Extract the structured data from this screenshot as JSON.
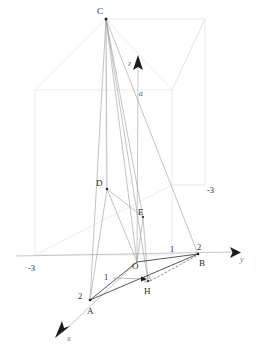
{
  "figure": {
    "background_color": "#ffffff",
    "ink_color": "#2b2b2b"
  },
  "axes": {
    "x": {
      "label": "x",
      "arrow_tip": [
        57,
        336
      ],
      "origin": [
        137,
        262
      ]
    },
    "y": {
      "label": "y",
      "arrow_tip": [
        236,
        252
      ],
      "origin": [
        137,
        262
      ]
    },
    "z": {
      "label": "z",
      "arrow_tip": [
        138,
        56
      ],
      "origin": [
        137,
        262
      ]
    }
  },
  "ticks": [
    {
      "name": "y-negative-three",
      "text": "-3",
      "x": 34,
      "y": 268
    },
    {
      "name": "x-negative-three",
      "text": "-3",
      "x": 212,
      "y": 192
    },
    {
      "name": "y-one",
      "text": "1",
      "x": 172,
      "y": 250
    },
    {
      "name": "y-two",
      "text": "2",
      "x": 199,
      "y": 248
    },
    {
      "name": "x-one",
      "text": "1",
      "x": 107,
      "y": 277
    },
    {
      "name": "x-two",
      "text": "2",
      "x": 81,
      "y": 297
    }
  ],
  "points": [
    {
      "name": "point-C",
      "label": "C",
      "x": 106,
      "y": 19,
      "lx": 97,
      "ly": 14,
      "dot": true
    },
    {
      "name": "point-D",
      "label": "D",
      "x": 107,
      "y": 189,
      "lx": 97,
      "ly": 185,
      "dot": true
    },
    {
      "name": "point-E",
      "label": "E",
      "x": 143,
      "y": 217,
      "lx": 139,
      "ly": 215,
      "dot": true
    },
    {
      "name": "point-O",
      "label": "O",
      "x": 137,
      "y": 262,
      "lx": 134,
      "ly": 268,
      "dot": false
    },
    {
      "name": "point-H",
      "label": "H",
      "x": 148,
      "y": 281,
      "lx": 145,
      "ly": 293,
      "dot": true
    },
    {
      "name": "point-B",
      "label": "B",
      "x": 198,
      "y": 254,
      "lx": 200,
      "ly": 265,
      "dot": true
    },
    {
      "name": "point-A",
      "label": "A",
      "x": 90,
      "y": 300,
      "lx": 88,
      "ly": 313,
      "dot": true
    }
  ],
  "annotations": [
    {
      "name": "height-marker-a",
      "label": "a",
      "x": 140,
      "y": 95
    }
  ],
  "bounding_box": {
    "name": "reference-box",
    "front_face": [
      [
        35,
        90
      ],
      [
        35,
        255
      ],
      [
        172,
        255
      ],
      [
        172,
        90
      ]
    ],
    "top_back_corner": [
      205,
      20
    ],
    "top_front_corner": [
      106,
      19
    ],
    "depth_vector": [
      99,
      -70
    ]
  },
  "segments": [
    {
      "name": "edge-C-A",
      "from": "C",
      "to": "A",
      "style": "thin"
    },
    {
      "name": "edge-C-B",
      "from": "C",
      "to": "B",
      "style": "thin"
    },
    {
      "name": "edge-C-O",
      "from": "C",
      "to": "O",
      "style": "thin"
    },
    {
      "name": "edge-C-D",
      "from": "C",
      "to": "D",
      "style": "thin"
    },
    {
      "name": "edge-C-H",
      "from": "C",
      "to": "H",
      "style": "thin"
    },
    {
      "name": "edge-C-E",
      "from": "C",
      "to": "E",
      "style": "thin"
    },
    {
      "name": "edge-D-A",
      "from": "D",
      "to": "A",
      "style": "thin"
    },
    {
      "name": "edge-D-E",
      "from": "D",
      "to": "E",
      "style": "thin"
    },
    {
      "name": "edge-D-O",
      "from": "D",
      "to": "O",
      "style": "thin"
    },
    {
      "name": "edge-E-H",
      "from": "E",
      "to": "H",
      "style": "thin"
    },
    {
      "name": "edge-A-B",
      "from": "A",
      "to": "B",
      "style": "base"
    },
    {
      "name": "edge-A-O",
      "from": "A",
      "to": "O",
      "style": "base"
    },
    {
      "name": "edge-O-B",
      "from": "O",
      "to": "B",
      "style": "base"
    },
    {
      "name": "edge-H-B",
      "from": "H",
      "to": "B",
      "style": "dashed"
    }
  ]
}
